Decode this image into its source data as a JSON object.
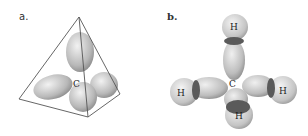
{
  "panels": [
    {
      "label": "a.",
      "description": "sp3 hybrid orbitals of carbon inside a tetrahedron",
      "center_atom": "C"
    },
    {
      "label": "b.",
      "description": "methane molecule: carbon bonded to four hydrogens",
      "center_atom": "C",
      "hydrogens": [
        "H",
        "H",
        "H",
        "H"
      ]
    }
  ],
  "colors": {
    "orbital_light": "#e0e0e0",
    "orbital_dark": "#9a9a9a",
    "overlap_dark": "#5a5a5a",
    "outline": "#555555"
  }
}
